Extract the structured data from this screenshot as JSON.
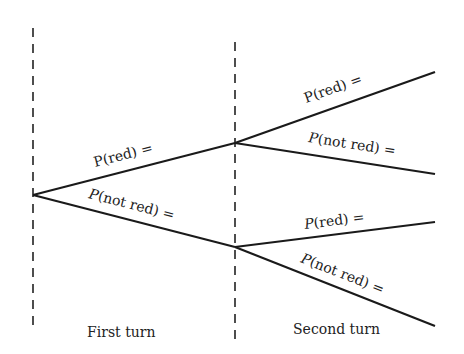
{
  "diagram": {
    "type": "probability-tree",
    "stages": [
      {
        "id": "first",
        "label": "First turn"
      },
      {
        "id": "second",
        "label": "Second turn"
      }
    ],
    "branches": {
      "first_red": {
        "label_p": "P",
        "label_rest": "(red) ="
      },
      "first_not_red": {
        "label_p": "P",
        "label_rest": "(not red) ="
      },
      "second_red_after_red": {
        "label_p": "P",
        "label_rest": "(red) ="
      },
      "second_not_red_after_red": {
        "label_p": "P",
        "label_rest": "(not red) ="
      },
      "second_red_after_not_red": {
        "label_p": "P",
        "label_rest": "(red) ="
      },
      "second_not_red_after_not_red": {
        "label_p": "P",
        "label_rest": "(not red) ="
      }
    },
    "colors": {
      "line": "#1a1a1a",
      "text": "#222222",
      "background": "#ffffff"
    }
  }
}
